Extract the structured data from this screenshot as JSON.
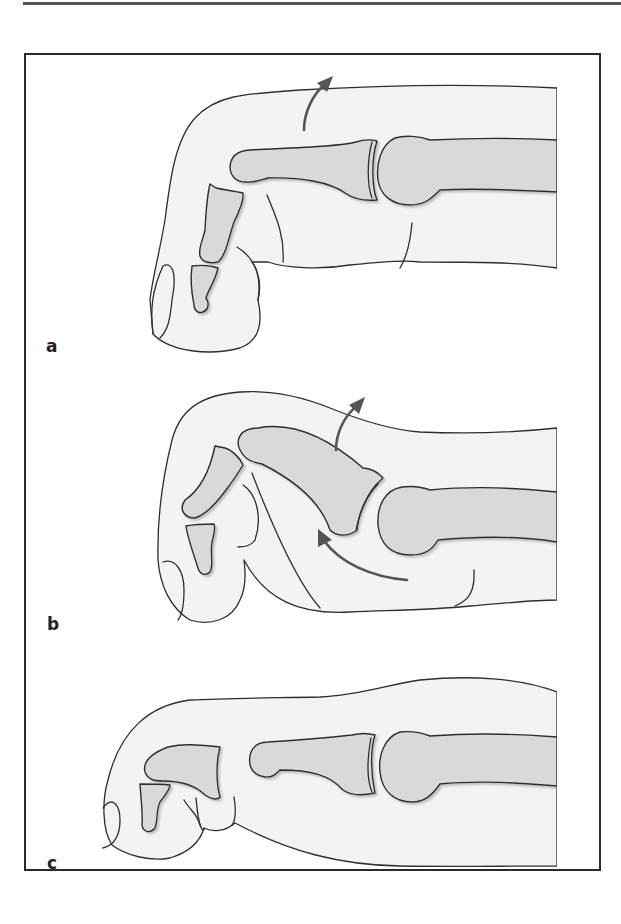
{
  "figure": {
    "type": "anatomical-illustration",
    "colors": {
      "skin_fill": "#f3f3f3",
      "bone_fill": "#d9d9d9",
      "outline": "#2f2f2f",
      "arrow": "#555555",
      "frame": "#2a2a2a"
    },
    "panels": [
      {
        "id": "a",
        "label": "a",
        "arrows": [
          "dorsal-up"
        ]
      },
      {
        "id": "b",
        "label": "b",
        "arrows": [
          "dorsal-up",
          "palmar-curved"
        ]
      },
      {
        "id": "c",
        "label": "c",
        "arrows": []
      }
    ]
  }
}
